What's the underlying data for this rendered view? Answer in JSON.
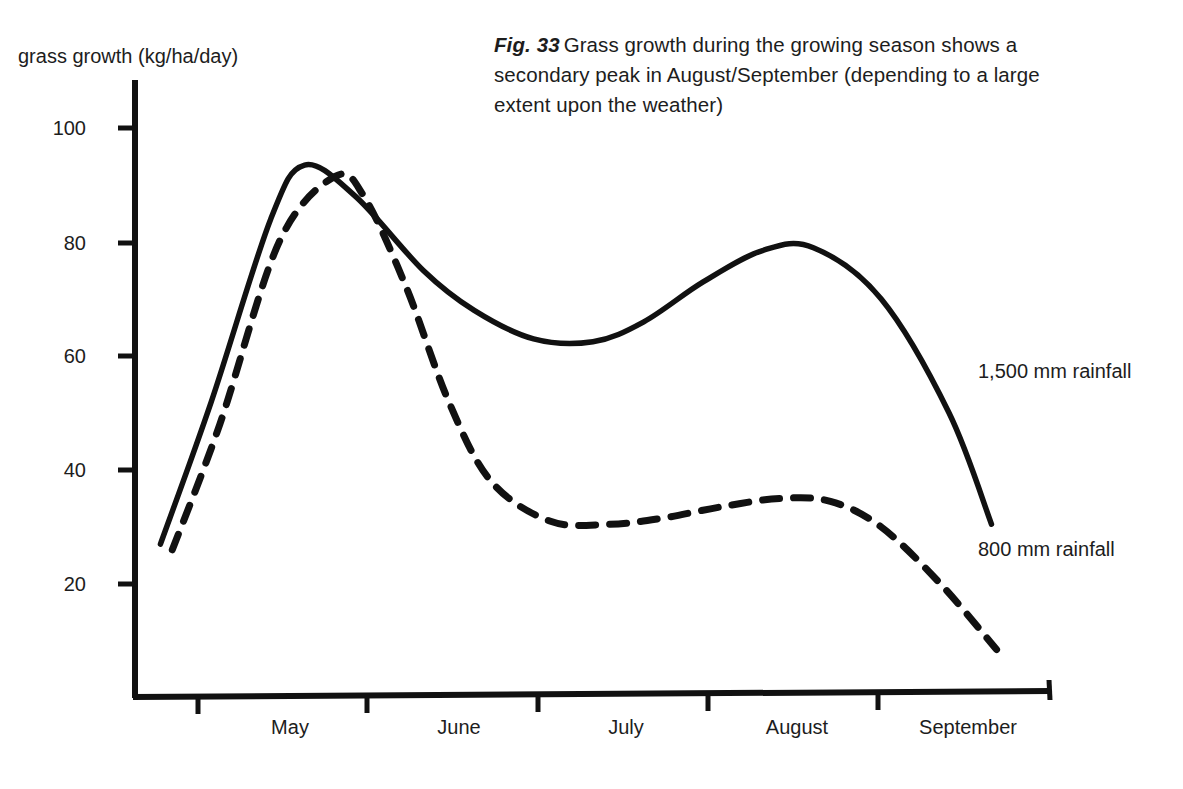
{
  "caption": {
    "figure_number": "Fig. 33",
    "text": "Grass growth during the growing season shows a secondary peak in August/September (depending to a large extent upon the weather)"
  },
  "chart_data": {
    "type": "line",
    "xlabel": "",
    "ylabel": "grass growth (kg/ha/day)",
    "ylim": [
      0,
      110
    ],
    "yticks": [
      20,
      40,
      60,
      80,
      100
    ],
    "ytick_labels": [
      "20",
      "40",
      "60",
      "80",
      "100"
    ],
    "categories": [
      "May",
      "June",
      "July",
      "August",
      "September"
    ],
    "xtick_labels": [
      "May",
      "June",
      "July",
      "August",
      "September"
    ],
    "grid": false,
    "legend_position": "inline-right",
    "series": [
      {
        "name": "1,500 mm rainfall",
        "style": "solid",
        "color": "#111111",
        "label_value": "1,500 mm rainfall",
        "x": [
          0.15,
          0.45,
          0.8,
          1.0,
          1.3,
          1.7,
          2.0,
          2.35,
          2.7,
          3.0,
          3.35,
          3.7,
          4.0,
          4.4,
          4.8,
          5.05
        ],
        "values": [
          27,
          52,
          84,
          93.5,
          88,
          75,
          68,
          63,
          62.5,
          66,
          73,
          78.5,
          79,
          70,
          50,
          30.5
        ]
      },
      {
        "name": "800 mm rainfall",
        "style": "dashed",
        "color": "#111111",
        "label_value": "800 mm rainfall",
        "x": [
          0.22,
          0.5,
          0.85,
          1.18,
          1.35,
          1.6,
          1.85,
          2.1,
          2.45,
          2.8,
          3.1,
          3.45,
          3.8,
          4.1,
          4.4,
          4.75,
          5.08
        ],
        "values": [
          26,
          48,
          80,
          91.5,
          88,
          72,
          52,
          38,
          31,
          30.5,
          31.5,
          33.5,
          35,
          34.5,
          30,
          20,
          8.5
        ]
      }
    ],
    "annotations": [
      {
        "text": "1,500 mm rainfall",
        "series": "1,500 mm rainfall"
      },
      {
        "text": "800 mm rainfall",
        "series": "800 mm rainfall"
      }
    ]
  },
  "axes": {
    "y_title": "grass growth (kg/ha/day)"
  }
}
